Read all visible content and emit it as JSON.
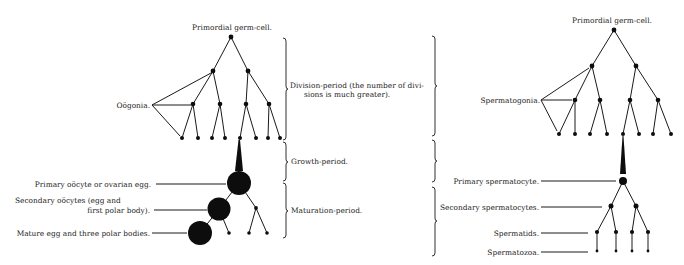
{
  "oogenesis": {
    "title": "Primordial germ-cell.",
    "oogonia_label": "Oögonia.",
    "primary_label": "Primary oöcyte or ovarian egg.",
    "secondary_label_1": "Secondary oöcytes (egg and",
    "secondary_label_2": "first polar body).",
    "mature_label": "Mature egg and three polar bodies."
  },
  "periods": {
    "division_1": "Division-period (the number of divi-",
    "division_2": "sions is much greater).",
    "growth": "Growth-period.",
    "maturation": "Maturation-period."
  },
  "spermatogenesis": {
    "title": "Primordial germ-cell.",
    "spermatogonia_label": "Spermatogonia.",
    "primary_label": "Primary spermatocyte.",
    "secondary_label": "Secondary spermatocytes.",
    "spermatids_label": "Spermatids.",
    "spermatozoa_label": "Spermatozoa."
  },
  "colors": {
    "ink": "#1a1a1a",
    "background": "#ffffff"
  }
}
